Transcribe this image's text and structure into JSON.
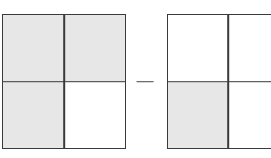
{
  "figure": {
    "background_color": "#ffffff",
    "line_color": "#3a3a3a",
    "shade_color": "#e7e7e7",
    "operator": {
      "symbol": "—",
      "name": "minus-sign",
      "color": "#6d6d6d"
    },
    "squares": [
      {
        "id": "left-square",
        "label": "",
        "rows": 2,
        "columns": 2,
        "total_parts": 4,
        "shaded_parts": 3,
        "fraction": "3/4",
        "quadrants": [
          {
            "position": "top-left",
            "shaded": true
          },
          {
            "position": "top-right",
            "shaded": true
          },
          {
            "position": "bottom-left",
            "shaded": true
          },
          {
            "position": "bottom-right",
            "shaded": false
          }
        ]
      },
      {
        "id": "right-square",
        "label": "",
        "rows": 2,
        "columns": 2,
        "total_parts": 4,
        "shaded_parts": 1,
        "fraction": "1/4",
        "clipped_at_right_edge": true,
        "quadrants": [
          {
            "position": "top-left",
            "shaded": false
          },
          {
            "position": "top-right",
            "shaded": false
          },
          {
            "position": "bottom-left",
            "shaded": true
          },
          {
            "position": "bottom-right",
            "shaded": false
          }
        ]
      }
    ]
  },
  "chart_data": {
    "type": "bar",
    "title": "",
    "xlabel": "",
    "ylabel": "",
    "categories": [
      "left-square",
      "right-square"
    ],
    "values": [
      0.75,
      0.25
    ],
    "series": [
      {
        "name": "shaded fraction of square",
        "values": [
          0.75,
          0.25
        ]
      }
    ],
    "annotations": [
      "—"
    ],
    "grid": false,
    "legend": "none",
    "ylim": [
      0,
      1
    ]
  }
}
